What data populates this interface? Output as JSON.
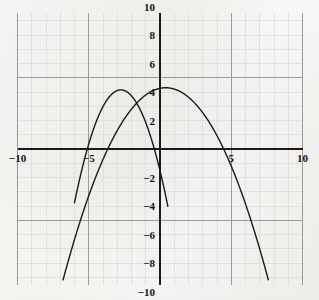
{
  "figure": {
    "kind": "graph-paper-plot",
    "background_color": "#f7f6f4",
    "ink_color": "#1a1a1a",
    "minor_grid_color": "#dcdcdc",
    "major_grid_color": "#9a9a9a",
    "axis_color": "#1a1a1a"
  },
  "chart_data": {
    "type": "line",
    "title": "",
    "subtitle": "",
    "xlabel": "",
    "ylabel": "",
    "xlim": [
      -10.0,
      10.0
    ],
    "ylim": [
      -10.0,
      10.0
    ],
    "grid": true,
    "minor_grid_step": 1,
    "major_grid_step": 5,
    "legend": "none",
    "axis_origin": [
      0,
      0
    ],
    "x_ticks": [
      -10,
      -5,
      5,
      10
    ],
    "x_tick_labels": [
      "−10",
      "−5",
      "5",
      "10"
    ],
    "y_ticks": [
      10,
      8,
      6,
      4,
      2,
      -2,
      -4,
      -6,
      -8,
      -10
    ],
    "y_tick_labels": [
      "10",
      "8",
      "6",
      "4",
      "2",
      "−2",
      "−4",
      "−6",
      "−8",
      "−10"
    ],
    "annotations": [],
    "series": [
      {
        "name": "left-parabola",
        "kind": "parabola",
        "opens": "down",
        "color": "#1a1a1a",
        "line_width": 1.4,
        "vertex": [
          -2.75,
          4.15
        ],
        "leading_coefficient": -0.75,
        "x_intercepts": [
          -5.1,
          -0.4
        ],
        "y_intercept": -1.5,
        "x_domain": [
          -6.0,
          0.55
        ],
        "y_clip": [
          -10.0,
          10.0
        ],
        "x": [
          -6.0,
          -5.5,
          -5.1,
          -4.5,
          -4.0,
          -3.5,
          -3.0,
          -2.75,
          -2.5,
          -2.0,
          -1.5,
          -1.0,
          -0.4,
          0.0,
          0.55
        ],
        "y": [
          -4.44,
          -1.41,
          0.0,
          1.95,
          2.98,
          3.73,
          4.11,
          4.15,
          4.11,
          3.73,
          2.98,
          1.95,
          0.0,
          -1.52,
          -4.44
        ]
      },
      {
        "name": "right-parabola",
        "kind": "parabola",
        "opens": "down",
        "color": "#1a1a1a",
        "line_width": 1.4,
        "vertex": [
          0.4,
          4.3
        ],
        "leading_coefficient": -0.26,
        "x_intercepts": [
          -3.67,
          4.47
        ],
        "y_intercept": 4.26,
        "x_domain": [
          -6.8,
          7.6
        ],
        "y_clip": [
          -10.0,
          10.0
        ],
        "x": [
          -6.8,
          -6.0,
          -5.0,
          -4.0,
          -3.67,
          -3.0,
          -2.0,
          -1.0,
          0.0,
          0.4,
          1.0,
          2.0,
          3.0,
          4.0,
          4.47,
          5.0,
          6.0,
          7.0,
          7.6
        ],
        "y": [
          -8.92,
          -6.08,
          -3.03,
          -0.45,
          0.0,
          1.76,
          3.43,
          4.0,
          4.26,
          4.3,
          4.21,
          3.48,
          2.14,
          0.2,
          -1.0,
          -2.56,
          -5.61,
          -9.26,
          -10.0
        ]
      }
    ]
  }
}
